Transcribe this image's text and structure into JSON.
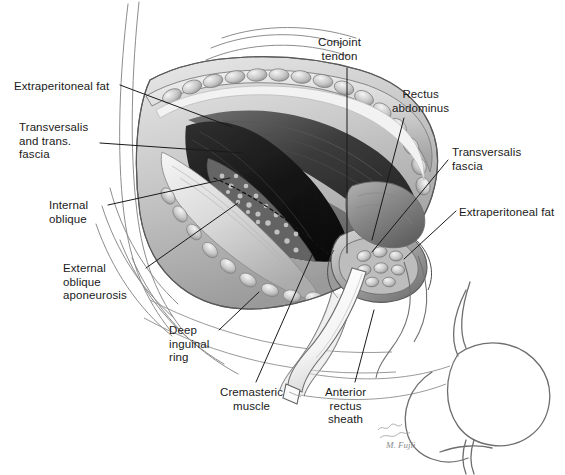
{
  "figure": {
    "background_color": "#ffffff",
    "ink_color": "#1a1a1a",
    "signature": "M. Fujii"
  },
  "labels": [
    {
      "id": "extraperitoneal-fat-left",
      "text": "Extraperitoneal fat",
      "lines": [
        "Extraperitoneal fat"
      ],
      "x": 14,
      "y": 80,
      "align": "left",
      "leader": {
        "x1": 120,
        "y1": 85,
        "x2": 232,
        "y2": 127
      }
    },
    {
      "id": "transversalis-and-trans-fascia",
      "text": "Transversalis and trans. fascia",
      "lines": [
        "Transversalis",
        "and trans.",
        "fascia"
      ],
      "x": 19,
      "y": 121,
      "align": "left",
      "leader": {
        "x1": 100,
        "y1": 143,
        "x2": 243,
        "y2": 153
      }
    },
    {
      "id": "internal-oblique",
      "text": "Internal oblique",
      "lines": [
        "Internal",
        "oblique"
      ],
      "x": 49,
      "y": 199,
      "align": "left",
      "leader": {
        "x1": 108,
        "y1": 205,
        "x2": 230,
        "y2": 178
      }
    },
    {
      "id": "external-oblique-aponeurosis",
      "text": "External oblique aponeurosis",
      "lines": [
        "External",
        "oblique",
        "aponeurosis"
      ],
      "x": 63,
      "y": 262,
      "align": "left",
      "leader": {
        "x1": 146,
        "y1": 268,
        "x2": 238,
        "y2": 203
      }
    },
    {
      "id": "deep-inguinal-ring",
      "text": "Deep inguinal ring",
      "lines": [
        "Deep",
        "inguinal",
        "ring"
      ],
      "x": 169,
      "y": 324,
      "align": "left",
      "leader": {
        "x1": 219,
        "y1": 330,
        "x2": 259,
        "y2": 292
      }
    },
    {
      "id": "cremasteric-muscle",
      "text": "Cremasteric muscle",
      "lines": [
        "Cremasteric",
        "muscle"
      ],
      "x": 220,
      "y": 386,
      "align": "left",
      "leader": {
        "x1": 256,
        "y1": 382,
        "x2": 312,
        "y2": 255
      }
    },
    {
      "id": "anterior-rectus-sheath",
      "text": "Anterior rectus sheath",
      "lines": [
        "Anterior",
        "rectus",
        "sheath"
      ],
      "x": 325,
      "y": 386,
      "align": "left",
      "leader": {
        "x1": 355,
        "y1": 382,
        "x2": 374,
        "y2": 310
      }
    },
    {
      "id": "conjoint-tendon",
      "text": "Conjoint tendon",
      "lines": [
        "Conjoint",
        "tendon"
      ],
      "x": 318,
      "y": 36,
      "align": "left",
      "leader": {
        "x1": 347,
        "y1": 68,
        "x2": 347,
        "y2": 253
      }
    },
    {
      "id": "rectus-abdominus",
      "text": "Rectus abdominus",
      "lines": [
        "Rectus",
        "abdominus"
      ],
      "x": 392,
      "y": 88,
      "align": "left",
      "leader": {
        "x1": 404,
        "y1": 118,
        "x2": 372,
        "y2": 240
      }
    },
    {
      "id": "transversalis-fascia-right",
      "text": "Transversalis fascia",
      "lines": [
        "Transversalis",
        "fascia"
      ],
      "x": 452,
      "y": 146,
      "align": "left",
      "leader": {
        "x1": 448,
        "y1": 160,
        "x2": 372,
        "y2": 252
      }
    },
    {
      "id": "extraperitoneal-fat-right",
      "text": "Extraperitoneal fat",
      "lines": [
        "Extraperitoneal fat"
      ],
      "x": 459,
      "y": 206,
      "align": "left",
      "leader": {
        "x1": 456,
        "y1": 211,
        "x2": 404,
        "y2": 259
      }
    }
  ],
  "anatomy_structures": [
    "Extraperitoneal fat",
    "Transversalis and trans. fascia",
    "Internal oblique",
    "External oblique aponeurosis",
    "Deep inguinal ring",
    "Cremasteric muscle",
    "Anterior rectus sheath",
    "Conjoint tendon",
    "Rectus abdominus",
    "Transversalis fascia",
    "Spermatic cord with vessel loop",
    "Scrotum and thigh contour"
  ]
}
